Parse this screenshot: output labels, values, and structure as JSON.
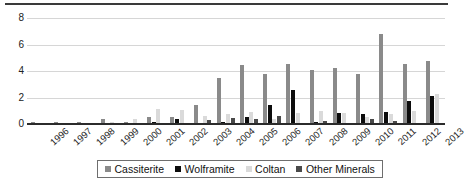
{
  "chart_data": {
    "type": "bar",
    "title": "",
    "xlabel": "",
    "ylabel": "",
    "ylim": [
      0,
      8
    ],
    "yticks": [
      "0",
      "2",
      "4",
      "6",
      "8"
    ],
    "grid": true,
    "legend_position": "bottom",
    "categories": [
      "1996",
      "1997",
      "1998",
      "1999",
      "2000",
      "2001",
      "2002",
      "2003",
      "2004",
      "2005",
      "2006",
      "2007",
      "2008",
      "2009",
      "2010",
      "2011",
      "2012",
      "2013"
    ],
    "series": [
      {
        "name": "Cassiterite",
        "color": "#8a8a8a",
        "values": [
          0.18,
          0.15,
          0.12,
          0.4,
          0.15,
          0.55,
          0.55,
          1.4,
          3.5,
          4.45,
          3.8,
          4.5,
          4.1,
          4.2,
          3.8,
          6.8,
          4.5,
          4.75
        ]
      },
      {
        "name": "Wolframite",
        "color": "#0d0d0d",
        "values": [
          0.03,
          0.02,
          0.02,
          0.03,
          0.02,
          0.15,
          0.35,
          0.1,
          0.15,
          0.5,
          1.4,
          2.6,
          0.15,
          0.8,
          0.75,
          0.9,
          1.7,
          2.1
        ]
      },
      {
        "name": "Coltan",
        "color": "#dadada",
        "values": [
          0.04,
          0.1,
          0.06,
          0.12,
          0.35,
          1.1,
          1.05,
          0.6,
          0.75,
          0.9,
          0.35,
          0.85,
          1.0,
          0.85,
          0.55,
          0.75,
          1.0,
          2.25
        ]
      },
      {
        "name": "Other Minerals",
        "color": "#4a4a4a",
        "values": [
          0.02,
          0.02,
          0.02,
          0.03,
          0.06,
          0.04,
          0.05,
          0.3,
          0.45,
          0.35,
          0.6,
          0.1,
          0.25,
          0.05,
          0.35,
          0.2,
          0.04,
          0.03
        ]
      }
    ]
  },
  "legend": {
    "items": [
      {
        "label": "Cassiterite"
      },
      {
        "label": "Wolframite"
      },
      {
        "label": "Coltan"
      },
      {
        "label": "Other Minerals"
      }
    ]
  }
}
